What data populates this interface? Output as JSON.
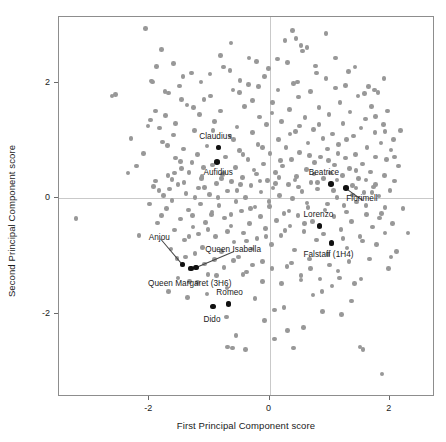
{
  "chart_data": {
    "type": "scatter",
    "title": "",
    "xlabel": "First Principal Component score",
    "ylabel": "Second Principal Component score",
    "xlim": [
      -3.5,
      2.75
    ],
    "ylim": [
      -3.45,
      3.15
    ],
    "xticks": [
      -2,
      0,
      2
    ],
    "xticklabels": [
      "-2",
      "0",
      "2"
    ],
    "yticks": [
      -2,
      0,
      2
    ],
    "yticklabels": [
      "-2",
      "0",
      "2"
    ],
    "grid": "zero-lines-only",
    "legend": "none",
    "point_color": "#989898",
    "highlight_color": "#111111",
    "frame_color": "#8d8d8d",
    "gridline_color": "#c9c9c9",
    "labeled_points": [
      {
        "label": "Claudius",
        "x": -0.85,
        "y": 0.88,
        "label_dx": -2,
        "label_dy": -10,
        "anchor": "middle"
      },
      {
        "label": "Aufidius",
        "x": -0.87,
        "y": 0.63,
        "label_dx": 2,
        "label_dy": 12,
        "anchor": "middle"
      },
      {
        "label": "Beatrice",
        "x": 1.02,
        "y": 0.25,
        "label_dx": -6,
        "label_dy": -10,
        "anchor": "middle"
      },
      {
        "label": "Florimell",
        "x": 1.27,
        "y": 0.18,
        "label_dx": 17,
        "label_dy": 12,
        "anchor": "middle",
        "leader": true
      },
      {
        "label": "Lorenzo",
        "x": 0.83,
        "y": -0.48,
        "label_dx": 0,
        "label_dy": -10,
        "anchor": "middle"
      },
      {
        "label": "Falstaff (1H4)",
        "x": 1.03,
        "y": -0.78,
        "label_dx": -2,
        "label_dy": 13,
        "anchor": "middle"
      },
      {
        "label": "Anjou",
        "x": -1.45,
        "y": -1.15,
        "label_dx": -22,
        "label_dy": -26,
        "anchor": "middle",
        "leader": true
      },
      {
        "label": "Queen Isabella",
        "x": -1.22,
        "y": -1.2,
        "label_dx": 38,
        "label_dy": -16,
        "anchor": "middle",
        "leader": true
      },
      {
        "label": "Queen Margaret (3H6)",
        "x": -1.31,
        "y": -1.22,
        "label_dx": 0,
        "label_dy": 16,
        "anchor": "middle"
      },
      {
        "label": "Romeo",
        "x": -0.68,
        "y": -1.83,
        "label_dx": 2,
        "label_dy": -10,
        "anchor": "middle"
      },
      {
        "label": "Dido",
        "x": -0.94,
        "y": -1.88,
        "label_dx": 0,
        "label_dy": 14,
        "anchor": "middle"
      }
    ],
    "points": [
      [
        -3.22,
        -0.35
      ],
      [
        -2.62,
        1.78
      ],
      [
        -2.35,
        0.44
      ],
      [
        -2.3,
        1.04
      ],
      [
        -2.21,
        0.56
      ],
      [
        -2.17,
        -0.64
      ],
      [
        -2.06,
        2.95
      ],
      [
        -2.02,
        1.26
      ],
      [
        -1.98,
        1.36
      ],
      [
        -1.95,
        2.02
      ],
      [
        -1.93,
        0.21
      ],
      [
        -1.9,
        0.3
      ],
      [
        -1.86,
        -0.43
      ],
      [
        -1.84,
        0.14
      ],
      [
        -1.83,
        1.22
      ],
      [
        -1.8,
        2.59
      ],
      [
        -1.78,
        0.98
      ],
      [
        -1.76,
        0.05
      ],
      [
        -1.73,
        1.44
      ],
      [
        -1.71,
        -0.18
      ],
      [
        -1.69,
        0.4
      ],
      [
        -1.68,
        1.83
      ],
      [
        -1.66,
        0.16
      ],
      [
        -1.64,
        -0.88
      ],
      [
        -1.62,
        0.33
      ],
      [
        -1.6,
        1.1
      ],
      [
        -1.58,
        -0.55
      ],
      [
        -1.56,
        0.7
      ],
      [
        -1.54,
        -1.04
      ],
      [
        -1.52,
        0.24
      ],
      [
        -1.5,
        1.95
      ],
      [
        -1.48,
        -0.36
      ],
      [
        -1.46,
        0.52
      ],
      [
        -1.45,
        -1.15
      ],
      [
        -1.43,
        0.86
      ],
      [
        -1.41,
        -0.72
      ],
      [
        -1.39,
        0.08
      ],
      [
        -1.37,
        1.62
      ],
      [
        -1.35,
        -0.2
      ],
      [
        -1.34,
        0.45
      ],
      [
        -1.33,
        -1.44
      ],
      [
        -1.31,
        -1.22
      ],
      [
        -1.29,
        0.62
      ],
      [
        -1.27,
        -0.5
      ],
      [
        -1.25,
        1.18
      ],
      [
        -1.24,
        0.02
      ],
      [
        -1.22,
        -1.2
      ],
      [
        -1.2,
        0.76
      ],
      [
        -1.18,
        -0.62
      ],
      [
        -1.16,
        1.46
      ],
      [
        -1.15,
        -0.1
      ],
      [
        -1.13,
        0.34
      ],
      [
        -1.11,
        -0.85
      ],
      [
        -1.09,
        1.72
      ],
      [
        -1.08,
        0.19
      ],
      [
        -1.06,
        -0.42
      ],
      [
        -1.04,
        0.91
      ],
      [
        -1.02,
        -1.32
      ],
      [
        -1.0,
        0.07
      ],
      [
        -0.99,
        2.16
      ],
      [
        -0.97,
        -0.28
      ],
      [
        -0.95,
        0.58
      ],
      [
        -0.94,
        -1.88
      ],
      [
        -0.92,
        1.33
      ],
      [
        -0.9,
        -0.66
      ],
      [
        -0.88,
        0.26
      ],
      [
        -0.87,
        0.63
      ],
      [
        -0.85,
        0.88
      ],
      [
        -0.84,
        -0.12
      ],
      [
        -0.82,
        1.52
      ],
      [
        -0.8,
        -0.92
      ],
      [
        -0.78,
        0.41
      ],
      [
        -0.77,
        2.28
      ],
      [
        -0.75,
        -0.34
      ],
      [
        -0.73,
        0.72
      ],
      [
        -0.71,
        -1.56
      ],
      [
        -0.7,
        0.13
      ],
      [
        -0.68,
        -1.83
      ],
      [
        -0.66,
        1.08
      ],
      [
        -0.64,
        -0.48
      ],
      [
        -0.63,
        0.29
      ],
      [
        -0.61,
        1.88
      ],
      [
        -0.59,
        -0.76
      ],
      [
        -0.57,
        0.54
      ],
      [
        -0.56,
        -0.05
      ],
      [
        -0.54,
        1.24
      ],
      [
        -0.52,
        -1.02
      ],
      [
        -0.5,
        0.83
      ],
      [
        -0.49,
        2.05
      ],
      [
        -0.47,
        -0.22
      ],
      [
        -0.45,
        0.36
      ],
      [
        -0.43,
        -0.6
      ],
      [
        -0.42,
        1.6
      ],
      [
        -0.4,
        0.01
      ],
      [
        -0.38,
        -1.28
      ],
      [
        -0.36,
        0.67
      ],
      [
        -0.35,
        1.98
      ],
      [
        -0.33,
        -0.44
      ],
      [
        -0.31,
        0.22
      ],
      [
        -0.29,
        -0.88
      ],
      [
        -0.28,
        1.14
      ],
      [
        -0.26,
        0.49
      ],
      [
        -0.24,
        -0.15
      ],
      [
        -0.22,
        2.38
      ],
      [
        -0.21,
        -0.7
      ],
      [
        -0.19,
        0.94
      ],
      [
        -0.17,
        1.41
      ],
      [
        -0.15,
        -0.32
      ],
      [
        -0.14,
        0.11
      ],
      [
        -0.12,
        -1.1
      ],
      [
        -0.1,
        0.6
      ],
      [
        -0.08,
        2.12
      ],
      [
        -0.07,
        -0.52
      ],
      [
        -0.05,
        1.28
      ],
      [
        -0.03,
        0.31
      ],
      [
        -0.01,
        -0.05
      ],
      [
        0.01,
        0.78
      ],
      [
        0.03,
        -0.8
      ],
      [
        0.05,
        1.66
      ],
      [
        0.06,
        0.18
      ],
      [
        0.08,
        -1.94
      ],
      [
        0.1,
        0.45
      ],
      [
        0.12,
        -0.38
      ],
      [
        0.13,
        2.42
      ],
      [
        0.15,
        1.02
      ],
      [
        0.17,
        0.05
      ],
      [
        0.19,
        -0.64
      ],
      [
        0.2,
        1.33
      ],
      [
        0.22,
        0.56
      ],
      [
        0.24,
        -0.26
      ],
      [
        0.26,
        2.74
      ],
      [
        0.27,
        0.88
      ],
      [
        0.29,
        -1.18
      ],
      [
        0.31,
        0.24
      ],
      [
        0.33,
        1.54
      ],
      [
        0.34,
        -0.48
      ],
      [
        0.36,
        0.68
      ],
      [
        0.38,
        0.0
      ],
      [
        0.4,
        2.0
      ],
      [
        0.41,
        -0.9
      ],
      [
        0.43,
        1.16
      ],
      [
        0.45,
        0.38
      ],
      [
        0.47,
        -0.3
      ],
      [
        0.48,
        1.76
      ],
      [
        0.5,
        0.8
      ],
      [
        0.52,
        -1.42
      ],
      [
        0.54,
        0.12
      ],
      [
        0.55,
        2.56
      ],
      [
        0.57,
        -0.58
      ],
      [
        0.59,
        1.4
      ],
      [
        0.61,
        0.5
      ],
      [
        0.62,
        -0.08
      ],
      [
        0.64,
        0.96
      ],
      [
        0.66,
        -1.05
      ],
      [
        0.68,
        1.86
      ],
      [
        0.69,
        0.28
      ],
      [
        0.71,
        -0.4
      ],
      [
        0.73,
        1.2
      ],
      [
        0.75,
        0.62
      ],
      [
        0.76,
        2.3
      ],
      [
        0.78,
        -0.72
      ],
      [
        0.8,
        0.16
      ],
      [
        0.82,
        1.58
      ],
      [
        0.83,
        -0.48
      ],
      [
        0.85,
        0.72
      ],
      [
        0.87,
        -1.62
      ],
      [
        0.89,
        1.04
      ],
      [
        0.9,
        0.34
      ],
      [
        0.92,
        -0.2
      ],
      [
        0.94,
        2.08
      ],
      [
        0.96,
        0.86
      ],
      [
        0.97,
        -0.98
      ],
      [
        0.99,
        1.46
      ],
      [
        1.01,
        0.44
      ],
      [
        1.02,
        0.25
      ],
      [
        1.03,
        -0.78
      ],
      [
        1.05,
        1.12
      ],
      [
        1.07,
        -0.32
      ],
      [
        1.08,
        0.58
      ],
      [
        1.1,
        1.92
      ],
      [
        1.12,
        0.02
      ],
      [
        1.14,
        -1.26
      ],
      [
        1.15,
        0.94
      ],
      [
        1.17,
        1.66
      ],
      [
        1.19,
        -0.54
      ],
      [
        1.21,
        0.4
      ],
      [
        1.22,
        1.3
      ],
      [
        1.24,
        -0.12
      ],
      [
        1.26,
        0.7
      ],
      [
        1.27,
        0.18
      ],
      [
        1.29,
        -0.86
      ],
      [
        1.31,
        2.2
      ],
      [
        1.33,
        0.52
      ],
      [
        1.34,
        1.5
      ],
      [
        1.36,
        -0.4
      ],
      [
        1.38,
        0.22
      ],
      [
        1.4,
        1.08
      ],
      [
        1.41,
        -1.48
      ],
      [
        1.43,
        0.76
      ],
      [
        1.45,
        -0.06
      ],
      [
        1.47,
        1.78
      ],
      [
        1.48,
        0.34
      ],
      [
        1.5,
        -0.66
      ],
      [
        1.52,
        1.22
      ],
      [
        1.54,
        0.6
      ],
      [
        1.55,
        -2.62
      ],
      [
        1.57,
        0.1
      ],
      [
        1.59,
        1.38
      ],
      [
        1.61,
        -0.28
      ],
      [
        1.62,
        0.88
      ],
      [
        1.64,
        1.94
      ],
      [
        1.66,
        -1.05
      ],
      [
        1.68,
        0.46
      ],
      [
        1.69,
        1.6
      ],
      [
        1.71,
        -0.5
      ],
      [
        1.73,
        0.2
      ],
      [
        1.75,
        1.14
      ],
      [
        1.76,
        0.72
      ],
      [
        1.78,
        -0.8
      ],
      [
        1.8,
        1.84
      ],
      [
        1.82,
        0.04
      ],
      [
        1.83,
        -0.34
      ],
      [
        1.85,
        0.96
      ],
      [
        1.87,
        -3.05
      ],
      [
        1.89,
        1.28
      ],
      [
        1.91,
        0.4
      ],
      [
        1.92,
        -0.6
      ],
      [
        1.94,
        0.68
      ],
      [
        1.96,
        1.52
      ],
      [
        1.98,
        -1.22
      ],
      [
        2.0,
        0.14
      ],
      [
        2.02,
        0.84
      ],
      [
        2.04,
        -0.44
      ],
      [
        2.06,
        1.02
      ],
      [
        2.08,
        0.3
      ],
      [
        2.11,
        -0.92
      ],
      [
        2.14,
        0.56
      ],
      [
        2.18,
        1.18
      ],
      [
        2.22,
        -0.18
      ],
      [
        2.3,
        -0.6
      ],
      [
        -1.96,
        2.04
      ],
      [
        -1.88,
        2.29
      ],
      [
        -1.74,
        1.86
      ],
      [
        -1.6,
        2.34
      ],
      [
        -1.46,
        1.72
      ],
      [
        -1.3,
        2.18
      ],
      [
        -1.14,
        2.02
      ],
      [
        -0.98,
        1.78
      ],
      [
        -0.82,
        2.48
      ],
      [
        -0.66,
        2.22
      ],
      [
        -0.5,
        1.84
      ],
      [
        -0.34,
        2.44
      ],
      [
        -0.18,
        1.94
      ],
      [
        -0.02,
        2.26
      ],
      [
        0.14,
        1.88
      ],
      [
        0.3,
        2.36
      ],
      [
        0.46,
        2.02
      ],
      [
        0.62,
        2.62
      ],
      [
        0.78,
        2.18
      ],
      [
        0.94,
        2.86
      ],
      [
        1.1,
        2.44
      ],
      [
        1.26,
        1.96
      ],
      [
        1.42,
        2.28
      ],
      [
        1.58,
        1.82
      ],
      [
        1.74,
        1.88
      ],
      [
        1.9,
        2.08
      ],
      [
        -1.68,
        -1.62
      ],
      [
        -1.52,
        -1.38
      ],
      [
        -1.36,
        -1.72
      ],
      [
        -1.2,
        -1.46
      ],
      [
        -1.04,
        -1.66
      ],
      [
        -0.88,
        -1.34
      ],
      [
        -0.72,
        -2.06
      ],
      [
        -0.56,
        -2.38
      ],
      [
        -0.4,
        -2.62
      ],
      [
        -0.24,
        -1.74
      ],
      [
        -0.08,
        -2.12
      ],
      [
        0.08,
        -2.44
      ],
      [
        0.24,
        -1.9
      ],
      [
        0.4,
        -2.6
      ],
      [
        0.56,
        -2.24
      ],
      [
        0.72,
        -1.68
      ],
      [
        0.88,
        -1.96
      ],
      [
        1.04,
        -1.52
      ],
      [
        1.2,
        -2.02
      ],
      [
        1.36,
        -1.78
      ],
      [
        1.52,
        -1.4
      ],
      [
        -0.7,
        -2.58
      ],
      [
        -0.62,
        -2.6
      ],
      [
        0.3,
        -2.3
      ],
      [
        -2.1,
        0.78
      ],
      [
        -2.0,
        -0.1
      ],
      [
        -1.9,
        1.52
      ],
      [
        -1.8,
        -0.3
      ],
      [
        -1.7,
        0.92
      ],
      [
        -1.56,
        1.3
      ],
      [
        -1.44,
        2.12
      ],
      [
        -1.26,
        1.58
      ],
      [
        -1.1,
        0.54
      ],
      [
        -0.94,
        1.18
      ],
      [
        -0.76,
        0.44
      ],
      [
        -0.6,
        1.02
      ],
      [
        -0.44,
        0.76
      ],
      [
        -0.28,
        1.7
      ],
      [
        -0.12,
        0.88
      ],
      [
        0.04,
        1.48
      ],
      [
        0.18,
        0.66
      ],
      [
        0.34,
        1.12
      ],
      [
        0.5,
        1.26
      ],
      [
        0.66,
        0.74
      ],
      [
        0.82,
        1.28
      ],
      [
        0.98,
        0.66
      ],
      [
        1.14,
        0.78
      ],
      [
        1.28,
        1.02
      ],
      [
        1.44,
        0.48
      ],
      [
        1.6,
        0.32
      ],
      [
        1.76,
        1.42
      ],
      [
        1.92,
        1.16
      ],
      [
        -1.62,
        -0.04
      ],
      [
        -1.48,
        0.64
      ],
      [
        -1.34,
        -0.66
      ],
      [
        -1.18,
        0.18
      ],
      [
        -1.02,
        -0.54
      ],
      [
        -0.86,
        0.02
      ],
      [
        -0.7,
        -0.58
      ],
      [
        -0.54,
        0.14
      ],
      [
        -0.38,
        -0.74
      ],
      [
        -0.22,
        0.42
      ],
      [
        -0.06,
        -0.66
      ],
      [
        0.1,
        0.26
      ],
      [
        0.26,
        -0.56
      ],
      [
        0.42,
        0.32
      ],
      [
        0.58,
        -0.44
      ],
      [
        0.74,
        0.42
      ],
      [
        0.9,
        -0.62
      ],
      [
        1.06,
        0.14
      ],
      [
        1.22,
        -0.7
      ],
      [
        1.38,
        0.06
      ],
      [
        1.54,
        -0.74
      ],
      [
        1.7,
        0.1
      ],
      [
        1.86,
        -0.26
      ],
      [
        2.02,
        -1.02
      ],
      [
        -1.4,
        -1.02
      ],
      [
        -1.24,
        -0.96
      ],
      [
        -1.08,
        -1.14
      ],
      [
        -0.92,
        -1.06
      ],
      [
        -0.76,
        -1.2
      ],
      [
        -0.6,
        -1.08
      ],
      [
        -0.44,
        -1.32
      ],
      [
        -0.28,
        -1.16
      ],
      [
        -0.12,
        -1.44
      ],
      [
        0.04,
        -1.22
      ],
      [
        0.2,
        -1.48
      ],
      [
        0.36,
        -1.12
      ],
      [
        0.52,
        -1.34
      ],
      [
        0.68,
        -1.22
      ],
      [
        0.84,
        -1.4
      ],
      [
        1.0,
        -1.16
      ],
      [
        1.16,
        -1.38
      ],
      [
        1.32,
        -1.1
      ],
      [
        -1.58,
        0.44
      ],
      [
        -1.42,
        0.28
      ],
      [
        -1.28,
        -0.3
      ],
      [
        -1.12,
        0.38
      ],
      [
        -0.96,
        -0.24
      ],
      [
        -0.8,
        0.34
      ],
      [
        -0.64,
        -0.28
      ],
      [
        -0.48,
        0.24
      ],
      [
        -0.32,
        -0.18
      ],
      [
        -0.16,
        0.3
      ],
      [
        0.0,
        -0.14
      ],
      [
        0.16,
        0.36
      ],
      [
        0.32,
        -0.22
      ],
      [
        0.48,
        0.2
      ],
      [
        0.64,
        -0.16
      ],
      [
        0.8,
        0.28
      ],
      [
        0.96,
        -0.1
      ],
      [
        1.12,
        0.32
      ],
      [
        1.28,
        -0.24
      ],
      [
        1.44,
        0.18
      ],
      [
        1.6,
        -0.12
      ],
      [
        1.76,
        0.24
      ],
      [
        1.92,
        -0.16
      ],
      [
        2.08,
        0.72
      ],
      [
        -0.64,
        2.7
      ],
      [
        0.38,
        2.92
      ],
      [
        0.44,
        2.78
      ],
      [
        0.52,
        2.66
      ],
      [
        1.5,
        -2.58
      ],
      [
        -2.56,
        1.8
      ]
    ]
  }
}
